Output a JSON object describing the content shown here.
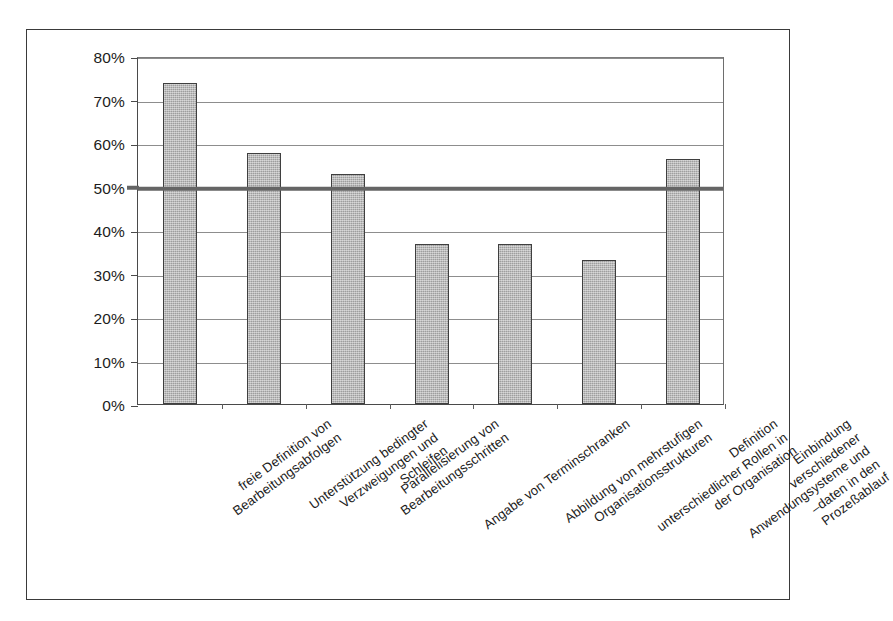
{
  "chart_data": {
    "type": "bar",
    "title": "",
    "subtitle": "",
    "xlabel": "",
    "ylabel": "",
    "ylim": [
      0,
      80
    ],
    "ytick_labels": [
      "0%",
      "10%",
      "20%",
      "30%",
      "40%",
      "50%",
      "60%",
      "70%",
      "80%"
    ],
    "ytick_values": [
      0,
      10,
      20,
      30,
      40,
      50,
      60,
      70,
      80
    ],
    "grid": "horizontal",
    "legend": "none",
    "bar_color": "#b4b4b4",
    "bar_edge_color": "#3f3f3f",
    "reference_line": {
      "value": 50,
      "label": "50%",
      "color": "#656565",
      "width_px": 4.5
    },
    "categories": [
      "freie Definition von Bearbeitungsabfolgen",
      "Unterstützung bedingter Verzweigungen und Schleifen",
      "Parallelisierung von Bearbeitungsschritten",
      "Angabe von Terminschranken",
      "Abbildung von mehrstufigen Organisationsstrukturen",
      "Definition unterschiedlicher Rollen in der Organisation",
      "Einbindung verschiedener Anwendungsysteme und –daten in den Prozeßablauf"
    ],
    "category_lines": [
      [
        "freie Definition von",
        "Bearbeitungsabfolgen"
      ],
      [
        "Unterstützung bedingter",
        "Verzweigungen und",
        "Schleifen"
      ],
      [
        "Parallelisierung von",
        "Bearbeitungsschritten"
      ],
      [
        "Angabe von Terminschranken"
      ],
      [
        "Abbildung von mehrstufigen",
        "Organisationsstrukturen"
      ],
      [
        "Definition",
        "unterschiedlicher Rollen in",
        "der Organisation"
      ],
      [
        "Einbindung",
        "verschiedener",
        "Anwendungsysteme und",
        "–daten in den",
        "Prozeßablauf"
      ]
    ],
    "values": [
      73.7,
      57.8,
      52.8,
      36.9,
      36.9,
      33.1,
      56.3
    ]
  }
}
